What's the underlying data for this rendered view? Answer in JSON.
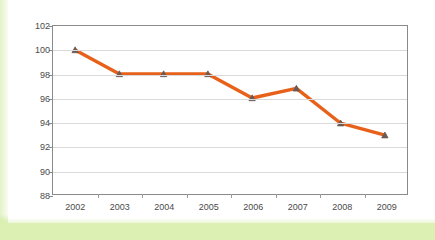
{
  "chart_data": {
    "type": "line",
    "title": "",
    "subtitle": "",
    "xlabel": "",
    "ylabel": "",
    "categories": [
      "2002",
      "2003",
      "2004",
      "2005",
      "2006",
      "2007",
      "2008",
      "2009"
    ],
    "series": [
      {
        "name": "series-1",
        "values": [
          100,
          98,
          98,
          98,
          96,
          96.8,
          93.9,
          92.9
        ],
        "color": "#E8611A",
        "marker": "triangle",
        "marker_color": "#6b5a55"
      }
    ],
    "ylim": [
      88,
      102
    ],
    "y_ticks": [
      88,
      90,
      92,
      94,
      96,
      98,
      100,
      102
    ],
    "y_tick_labels": [
      "88",
      "90",
      "92",
      "94",
      "96",
      "98",
      "100",
      "102"
    ],
    "grid": true,
    "grid_axis": "y",
    "legend": false,
    "legend_position": "none",
    "annotations": []
  },
  "style": {
    "line_color": "#E8611A",
    "grid_color": "#d9d9d9",
    "frame_color": "#8a8a8a",
    "tick_text_color": "#4a4a4a",
    "plot_background": "#ffffff",
    "page_background": "#ffffff",
    "page_tint": "#dcf0b4"
  }
}
